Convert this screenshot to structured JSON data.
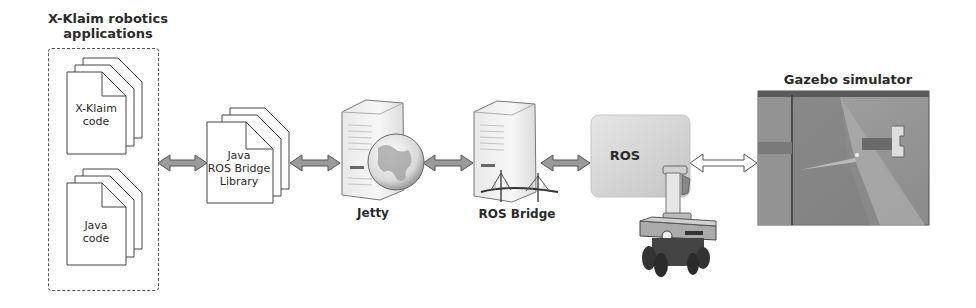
{
  "diagram": {
    "apps_group": {
      "title_line1": "X-Klaim robotics",
      "title_line2": "applications",
      "docs": [
        {
          "line1": "X-Klaim",
          "line2": "code"
        },
        {
          "line1": "Java",
          "line2": "code"
        }
      ]
    },
    "library": {
      "line1": "Java",
      "line2": "ROS Bridge",
      "line3": "Library"
    },
    "jetty": {
      "label": "Jetty",
      "icon": "server-globe-icon"
    },
    "ros_bridge": {
      "label": "ROS Bridge",
      "icon": "server-bridge-icon"
    },
    "ros": {
      "label": "ROS",
      "icon": "robot-icon"
    },
    "gazebo": {
      "title": "Gazebo simulator"
    },
    "connections": [
      {
        "from": "X-Klaim robotics applications",
        "to": "Java ROS Bridge Library",
        "style": "filled-double-arrow"
      },
      {
        "from": "Java ROS Bridge Library",
        "to": "Jetty",
        "style": "filled-double-arrow"
      },
      {
        "from": "Jetty",
        "to": "ROS Bridge",
        "style": "filled-double-arrow"
      },
      {
        "from": "ROS Bridge",
        "to": "ROS",
        "style": "filled-double-arrow"
      },
      {
        "from": "ROS",
        "to": "Gazebo simulator",
        "style": "hollow-double-arrow"
      }
    ],
    "colors": {
      "arrow_fill": "#9a9a9a",
      "arrow_stroke": "#555555",
      "ros_box": "#d4d4d4",
      "gazebo_bg": "#8c8c8c"
    }
  }
}
